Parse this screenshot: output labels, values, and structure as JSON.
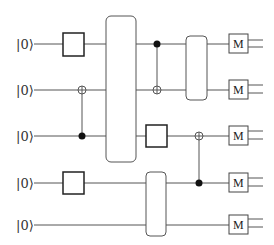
{
  "diagram": {
    "type": "quantum-circuit",
    "qubits": [
      {
        "label": "|0⟩",
        "y": 44
      },
      {
        "label": "|0⟩",
        "y": 90
      },
      {
        "label": "|0⟩",
        "y": 136
      },
      {
        "label": "|0⟩",
        "y": 183
      },
      {
        "label": "|0⟩",
        "y": 225
      }
    ],
    "measurement_label": "M",
    "gates": [
      {
        "kind": "single",
        "qubit": 0,
        "x": 63
      },
      {
        "kind": "cnot",
        "control": 2,
        "target": 1,
        "x": 82
      },
      {
        "kind": "multi",
        "qubits": [
          0,
          1,
          2
        ],
        "x": 106
      },
      {
        "kind": "cz-like",
        "control": 0,
        "target": 1,
        "x": 157
      },
      {
        "kind": "multi",
        "qubits": [
          0,
          1
        ],
        "x": 186
      },
      {
        "kind": "single",
        "qubit": 2,
        "x": 146
      },
      {
        "kind": "single",
        "qubit": 3,
        "x": 63
      },
      {
        "kind": "multi",
        "qubits": [
          3,
          4
        ],
        "x": 146
      },
      {
        "kind": "cnot",
        "control": 3,
        "target": 2,
        "x": 199
      }
    ]
  }
}
